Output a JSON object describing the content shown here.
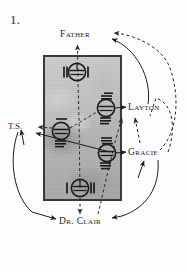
{
  "figure": {
    "number": "1.",
    "caption_present": false
  },
  "panel": {
    "name": "grey-photo-panel",
    "description": "mottled grey photographic rectangle",
    "border_color": "#3a3a3a",
    "fill_color": "#bdbdbd",
    "x": 43,
    "y": 55,
    "width": 79,
    "height": 146
  },
  "labels": {
    "father": "Father",
    "layton": "Layton",
    "ts": "T.S.",
    "gracie": "Gracie",
    "dr_clair": "Dr. Clair"
  },
  "nodes": [
    {
      "id": "n1",
      "name": "node-top",
      "cx": 77,
      "cy": 72,
      "r": 9,
      "tally_left": 2,
      "tally_right": 1,
      "tally_orientation": "vertical"
    },
    {
      "id": "n2",
      "name": "node-upper-right",
      "cx": 106,
      "cy": 108,
      "r": 9,
      "tally_above": 3,
      "tally_below": 3,
      "tally_orientation": "horizontal"
    },
    {
      "id": "n3",
      "name": "node-left",
      "cx": 61,
      "cy": 131,
      "r": 9,
      "tally_above": 1,
      "tally_below": 3,
      "tally_orientation": "horizontal"
    },
    {
      "id": "n4",
      "name": "node-lower-right",
      "cx": 107,
      "cy": 153,
      "r": 9,
      "tally_above": 3,
      "tally_below": 3,
      "tally_orientation": "horizontal"
    },
    {
      "id": "n5",
      "name": "node-bottom",
      "cx": 80,
      "cy": 188,
      "r": 9,
      "tally_left": 1,
      "tally_right": 2,
      "tally_orientation": "vertical"
    }
  ],
  "connectors": {
    "dashed_color": "#2a2a2a",
    "solid_color": "#1d1d1d",
    "items": [
      {
        "name": "connector-node-top-to-father",
        "style": "dashed",
        "from": "node-top",
        "to": "father"
      },
      {
        "name": "connector-node-upper-right-to-layton",
        "style": "solid",
        "from": "node-upper-right",
        "to": "layton"
      },
      {
        "name": "connector-node-left-to-ts",
        "style": "dashed",
        "from": "node-left",
        "to": "ts"
      },
      {
        "name": "connector-node-left-to-node-upper-right",
        "style": "dashed",
        "from": "node-left",
        "to": "node-upper-right"
      },
      {
        "name": "connector-node-lower-right-to-gracie",
        "style": "solid",
        "from": "node-lower-right",
        "to": "gracie"
      },
      {
        "name": "connector-node-lower-right-to-ts",
        "style": "solid",
        "from": "node-lower-right",
        "to": "ts"
      },
      {
        "name": "connector-node-bottom-to-dr-clair",
        "style": "dashed",
        "from": "node-bottom",
        "to": "dr-clair"
      },
      {
        "name": "connector-dr-clair-to-layton",
        "style": "dashed",
        "from": "dr-clair",
        "to": "layton"
      },
      {
        "name": "connector-gracie-to-layton",
        "style": "dashed",
        "from": "gracie",
        "to": "layton"
      },
      {
        "name": "connector-gracie-to-father",
        "style": "dashed",
        "from": "gracie",
        "to": "father"
      },
      {
        "name": "connector-layton-to-father",
        "style": "solid",
        "from": "layton",
        "to": "father"
      },
      {
        "name": "connector-ts-to-dr-clair",
        "style": "solid",
        "from": "ts",
        "to": "dr-clair"
      },
      {
        "name": "connector-gracie-to-dr-clair",
        "style": "solid",
        "from": "gracie",
        "to": "dr-clair"
      }
    ]
  }
}
